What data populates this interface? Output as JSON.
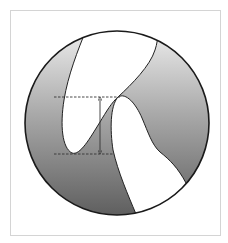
{
  "figure": {
    "type": "cross-section-diagram",
    "colors": {
      "background": "#ffffff",
      "frame_border": "#d4d4d4",
      "circle_stroke": "#1a1a1a",
      "gradient_top": "#ececec",
      "gradient_bottom": "#5f5f5f",
      "white_region": "#ffffff",
      "dashed_line": "#333333",
      "arrow": "#333333"
    },
    "elements": {
      "circle": {
        "cx": 117,
        "cy": 123,
        "r": 92
      },
      "upper_white_region": {
        "label": ""
      },
      "lower_white_region": {
        "label": ""
      },
      "dashed_line_top": {
        "y": 97,
        "x1": 54,
        "x2": 120
      },
      "dashed_line_bottom": {
        "y": 154,
        "x1": 54,
        "x2": 114
      },
      "measurement_arrow": {
        "x": 100,
        "y1": 98,
        "y2": 153,
        "label": ""
      }
    }
  }
}
